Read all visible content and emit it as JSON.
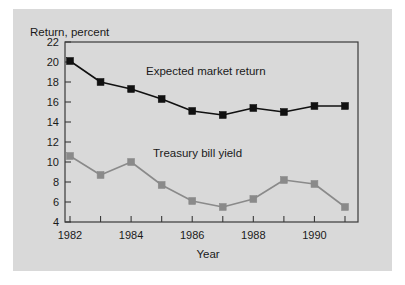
{
  "figure": {
    "background_color": "#d9d9d9",
    "page_color": "#ffffff",
    "frame_color": "#3a3a3a"
  },
  "axes": {
    "y_title": "Return, percent",
    "x_title": "Year",
    "y_ticks": [
      "22",
      "20",
      "18",
      "16",
      "14",
      "12",
      "10",
      "8",
      "6",
      "4"
    ],
    "x_ticks": [
      "1982",
      "1984",
      "1986",
      "1988",
      "1990"
    ]
  },
  "series_labels": {
    "expected": "Expected market return",
    "treasury": "Treasury bill yield"
  },
  "chart_data": {
    "type": "line",
    "title": "",
    "xlabel": "Year",
    "ylabel": "Return, percent",
    "xlim": [
      1981.6,
      1991.4
    ],
    "ylim": [
      4,
      22
    ],
    "ytick_step": 2,
    "grid": false,
    "legend_position": "inline-annotation",
    "x": [
      1982,
      1983,
      1984,
      1985,
      1986,
      1987,
      1988,
      1989,
      1990,
      1991
    ],
    "xtick_labels_shown": [
      "1982",
      "1984",
      "1986",
      "1988",
      "1990"
    ],
    "series": [
      {
        "name": "Expected market return",
        "color": "#111111",
        "marker": "square",
        "values": [
          20.1,
          18.0,
          17.3,
          16.3,
          15.1,
          14.7,
          15.4,
          15.0,
          15.6,
          15.6
        ]
      },
      {
        "name": "Treasury bill yield",
        "color": "#8a8a8a",
        "marker": "square",
        "values": [
          10.6,
          8.7,
          10.0,
          7.7,
          6.1,
          5.5,
          6.3,
          8.2,
          7.8,
          5.5
        ]
      }
    ]
  }
}
